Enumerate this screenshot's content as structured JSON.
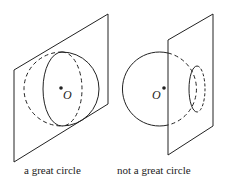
{
  "figures": [
    {
      "id": "left",
      "center_label": "O",
      "caption": "a great circle"
    },
    {
      "id": "right",
      "center_label": "O",
      "caption": "not a great circle"
    }
  ],
  "colors": {
    "stroke": "#222222",
    "background": "#ffffff"
  }
}
